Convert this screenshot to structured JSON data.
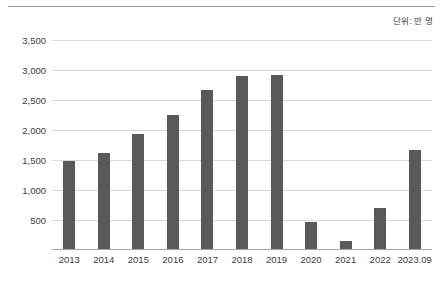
{
  "unit_caption": "단위: 만 명",
  "chart_data": {
    "type": "bar",
    "title": "",
    "subtitle": "",
    "xlabel": "",
    "ylabel": "",
    "unit_note": "단위: 만 명",
    "categories": [
      "2013",
      "2014",
      "2015",
      "2016",
      "2017",
      "2018",
      "2019",
      "2020",
      "2021",
      "2022",
      "2023.09"
    ],
    "values": [
      1480,
      1620,
      1940,
      2250,
      2660,
      2900,
      2910,
      470,
      150,
      700,
      1670
    ],
    "series": [
      {
        "name": "",
        "values": [
          1480,
          1620,
          1940,
          2250,
          2660,
          2900,
          2910,
          470,
          150,
          700,
          1670
        ]
      }
    ],
    "ylim": [
      0,
      3500
    ],
    "yticks": [
      500,
      1000,
      1500,
      2000,
      2500,
      3000,
      3500
    ],
    "ytick_labels": [
      "500",
      "1,000",
      "1,500",
      "2,000",
      "2,500",
      "3,000",
      "3,500"
    ],
    "grid": true,
    "legend": false,
    "legend_position": "none",
    "bar_color": "#595959",
    "gridline_color": "#d9d9d9",
    "axis_color": "#a6a6a6",
    "text_color": "#404040"
  }
}
